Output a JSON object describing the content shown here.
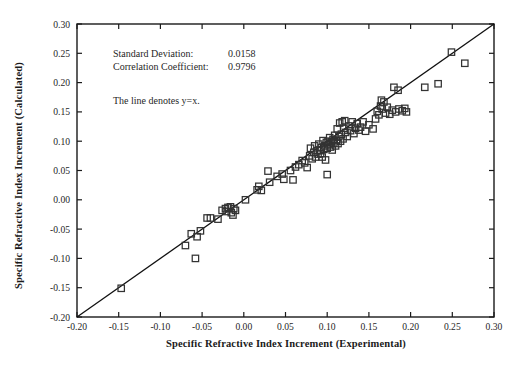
{
  "chart_data": {
    "type": "scatter",
    "title": "",
    "xlabel": "Specific Refractive Index Increment (Experimental)",
    "ylabel": "Specific Refractive Index Increment (Calculated)",
    "xlim": [
      -0.2,
      0.3
    ],
    "ylim": [
      -0.2,
      0.3
    ],
    "xticks": [
      -0.2,
      -0.15,
      -0.1,
      -0.05,
      0.0,
      0.05,
      0.1,
      0.15,
      0.2,
      0.25,
      0.3
    ],
    "yticks": [
      -0.2,
      -0.15,
      -0.1,
      -0.05,
      0.0,
      0.05,
      0.1,
      0.15,
      0.2,
      0.25,
      0.3
    ],
    "xtick_labels": [
      "-0.20",
      "-0.15",
      "-0.10",
      "-0.05",
      "0.00",
      "0.05",
      "0.10",
      "0.15",
      "0.20",
      "0.25",
      "0.30"
    ],
    "ytick_labels": [
      "-0.20",
      "-0.15",
      "-0.10",
      "-0.05",
      "0.00",
      "0.05",
      "0.10",
      "0.15",
      "0.20",
      "0.25",
      "0.30"
    ],
    "grid": false,
    "legend": null,
    "marker": "open-square",
    "marker_color": "#333333",
    "line_color": "#111111",
    "reference_line": {
      "type": "identity",
      "slope": 1,
      "intercept": 0,
      "from": [
        -0.2,
        -0.2
      ],
      "to": [
        0.3,
        0.3
      ]
    },
    "series": [
      {
        "name": "Specific refractive index increment",
        "points": [
          [
            -0.147,
            -0.151
          ],
          [
            -0.058,
            -0.1
          ],
          [
            -0.07,
            -0.078
          ],
          [
            -0.063,
            -0.058
          ],
          [
            -0.052,
            -0.053
          ],
          [
            -0.056,
            -0.063
          ],
          [
            -0.044,
            -0.031
          ],
          [
            -0.04,
            -0.031
          ],
          [
            -0.031,
            -0.033
          ],
          [
            -0.026,
            -0.018
          ],
          [
            -0.022,
            -0.015
          ],
          [
            -0.019,
            -0.013
          ],
          [
            -0.021,
            -0.02
          ],
          [
            -0.016,
            -0.012
          ],
          [
            -0.015,
            -0.022
          ],
          [
            -0.013,
            -0.026
          ],
          [
            -0.012,
            -0.015
          ],
          [
            -0.01,
            -0.018
          ],
          [
            0.002,
            0.0
          ],
          [
            0.016,
            0.017
          ],
          [
            0.021,
            0.016
          ],
          [
            0.018,
            0.023
          ],
          [
            0.029,
            0.049
          ],
          [
            0.031,
            0.03
          ],
          [
            0.04,
            0.04
          ],
          [
            0.046,
            0.044
          ],
          [
            0.048,
            0.035
          ],
          [
            0.056,
            0.05
          ],
          [
            0.059,
            0.034
          ],
          [
            0.062,
            0.056
          ],
          [
            0.066,
            0.06
          ],
          [
            0.07,
            0.067
          ],
          [
            0.073,
            0.063
          ],
          [
            0.076,
            0.055
          ],
          [
            0.079,
            0.075
          ],
          [
            0.08,
            0.088
          ],
          [
            0.082,
            0.07
          ],
          [
            0.084,
            0.081
          ],
          [
            0.085,
            0.092
          ],
          [
            0.086,
            0.073
          ],
          [
            0.088,
            0.084
          ],
          [
            0.089,
            0.078
          ],
          [
            0.09,
            0.095
          ],
          [
            0.091,
            0.085
          ],
          [
            0.092,
            0.079
          ],
          [
            0.093,
            0.089
          ],
          [
            0.094,
            0.073
          ],
          [
            0.095,
            0.101
          ],
          [
            0.096,
            0.086
          ],
          [
            0.097,
            0.092
          ],
          [
            0.098,
            0.068
          ],
          [
            0.099,
            0.098
          ],
          [
            0.1,
            0.043
          ],
          [
            0.1,
            0.088
          ],
          [
            0.101,
            0.1
          ],
          [
            0.102,
            0.094
          ],
          [
            0.103,
            0.106
          ],
          [
            0.104,
            0.09
          ],
          [
            0.105,
            0.099
          ],
          [
            0.106,
            0.085
          ],
          [
            0.107,
            0.103
          ],
          [
            0.108,
            0.097
          ],
          [
            0.109,
            0.11
          ],
          [
            0.11,
            0.092
          ],
          [
            0.111,
            0.101
          ],
          [
            0.112,
            0.121
          ],
          [
            0.113,
            0.096
          ],
          [
            0.114,
            0.108
          ],
          [
            0.115,
            0.131
          ],
          [
            0.116,
            0.1
          ],
          [
            0.117,
            0.112
          ],
          [
            0.118,
            0.133
          ],
          [
            0.119,
            0.104
          ],
          [
            0.12,
            0.122
          ],
          [
            0.121,
            0.135
          ],
          [
            0.122,
            0.115
          ],
          [
            0.124,
            0.108
          ],
          [
            0.126,
            0.126
          ],
          [
            0.128,
            0.118
          ],
          [
            0.13,
            0.133
          ],
          [
            0.132,
            0.113
          ],
          [
            0.134,
            0.122
          ],
          [
            0.136,
            0.13
          ],
          [
            0.138,
            0.119
          ],
          [
            0.14,
            0.124
          ],
          [
            0.143,
            0.133
          ],
          [
            0.146,
            0.117
          ],
          [
            0.15,
            0.128
          ],
          [
            0.155,
            0.121
          ],
          [
            0.158,
            0.138
          ],
          [
            0.16,
            0.151
          ],
          [
            0.162,
            0.145
          ],
          [
            0.164,
            0.16
          ],
          [
            0.165,
            0.17
          ],
          [
            0.166,
            0.155
          ],
          [
            0.168,
            0.167
          ],
          [
            0.17,
            0.148
          ],
          [
            0.172,
            0.158
          ],
          [
            0.175,
            0.146
          ],
          [
            0.178,
            0.153
          ],
          [
            0.18,
            0.192
          ],
          [
            0.182,
            0.15
          ],
          [
            0.185,
            0.187
          ],
          [
            0.186,
            0.155
          ],
          [
            0.19,
            0.152
          ],
          [
            0.193,
            0.156
          ],
          [
            0.195,
            0.15
          ],
          [
            0.217,
            0.192
          ],
          [
            0.233,
            0.198
          ],
          [
            0.249,
            0.252
          ],
          [
            0.265,
            0.233
          ]
        ]
      }
    ],
    "annotations": [
      {
        "id": "std-dev",
        "label": "Standard Deviation:",
        "value": "0.0158"
      },
      {
        "id": "corr-coef",
        "label": "Correlation Coefficient:",
        "value": "0.9796"
      },
      {
        "id": "line-note",
        "label": "The line denotes y=x.",
        "value": ""
      }
    ]
  }
}
